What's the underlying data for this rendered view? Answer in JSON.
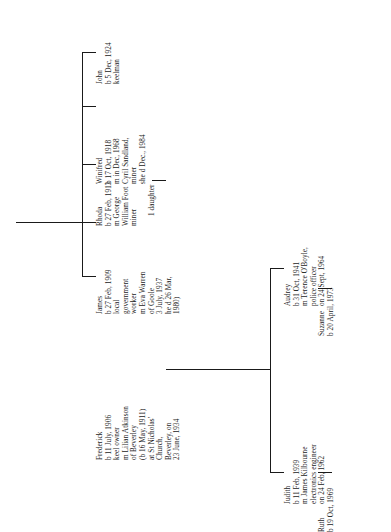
{
  "document": {
    "type": "family-tree-chart",
    "orientation": "rotated-90-counterclockwise",
    "ink_color": "#1a1a1a",
    "background_color": "#ffffff"
  },
  "people": {
    "frederick": {
      "name": "Frederick",
      "lines": [
        "Frederick",
        "b 11 July, 1906",
        "keel owner",
        "m Lilian Atkinson",
        "of Beverley",
        "(b 16 May, 1911)",
        "at St Nicholas'",
        "Church,",
        "Beverley, on",
        "23 June, 1934"
      ]
    },
    "james": {
      "name": "James",
      "lines": [
        "James",
        "b 27 Feb, 1909",
        "local",
        "government",
        "worker",
        "m Eva Warren",
        "of Goole",
        "3 July, 1937",
        "he d 26 Mar,",
        "1980)"
      ]
    },
    "rhoda": {
      "name": "Rhoda",
      "lines": [
        "Rhoda",
        "b 27 Feb, 1913",
        "m George",
        "William Foot",
        "miner"
      ]
    },
    "rhoda_issue": {
      "name": "1 daughter",
      "lines": [
        "1 daughter"
      ]
    },
    "winifred": {
      "name": "Winifred",
      "lines": [
        "Winifred",
        "b 17 Oct, 1918",
        "m in Dec, 1968",
        "Cyril Sandland,",
        "miner",
        "she d Dec., 1984"
      ]
    },
    "john": {
      "name": "John",
      "lines": [
        "John",
        "b 5 Dec, 1924",
        "keelman"
      ]
    },
    "audrey": {
      "name": "Audrey",
      "lines": [
        "Audrey",
        "b 31 Oct, 1941",
        "m Terence O'Boyle,",
        "police officer",
        "on 24 Sept, 1964"
      ]
    },
    "suzanne": {
      "name": "Suzanne",
      "lines": [
        "Suzanne",
        "b 20 April, 1973"
      ]
    },
    "judith": {
      "name": "Judith",
      "lines": [
        "Judith",
        "b 11 Feb, 1939",
        "m James Kilbourne",
        "electronics engineer",
        "on 24 Feb, 1962"
      ]
    },
    "ruth": {
      "name": "Ruth",
      "lines": [
        "Ruth",
        "b 19 Oct, 1969"
      ]
    }
  }
}
